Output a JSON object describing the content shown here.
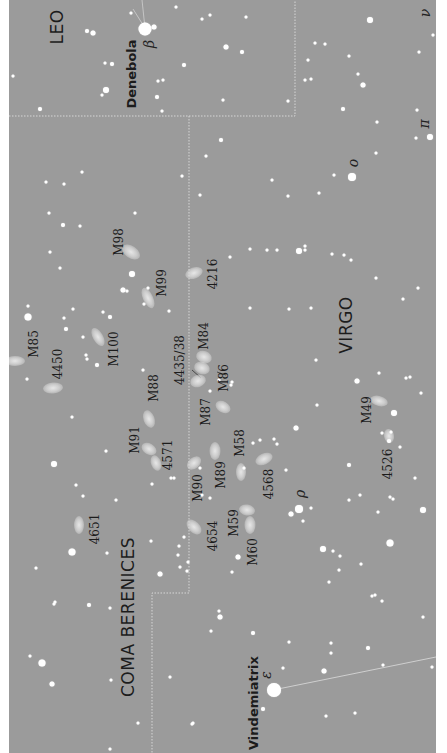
{
  "map": {
    "type": "star_chart",
    "orientation": "rotated -90deg",
    "colors": {
      "background": "#9b9b9b",
      "margin": "#ffffff",
      "stars": "#ffffff",
      "labels": "#1c1c1c",
      "boundary": "#cfcfcf"
    },
    "constellations": [
      {
        "name": "LEO",
        "x": 57,
        "y": 27
      },
      {
        "name": "VIRGO",
        "x": 337,
        "y": 325
      },
      {
        "name": "COMA BERENICES",
        "x": 128,
        "y": 617
      }
    ],
    "named_stars": [
      {
        "name": "Denebola",
        "greek": "β",
        "x": 131,
        "y": 74,
        "gx": 149,
        "gy": 42
      },
      {
        "name": "Vindemiatrix",
        "greek": "ε",
        "x": 253,
        "y": 703,
        "gx": 266,
        "gy": 673
      }
    ],
    "greek_labels": [
      {
        "letter": "ο",
        "x": 353,
        "y": 161
      },
      {
        "letter": "π",
        "x": 424,
        "y": 123
      },
      {
        "letter": "ν",
        "x": 425,
        "y": 13
      },
      {
        "letter": "ρ",
        "x": 300,
        "y": 496
      }
    ],
    "objects": [
      {
        "label": "M98",
        "x": 119,
        "y": 242
      },
      {
        "label": "M99",
        "x": 162,
        "y": 283
      },
      {
        "label": "4216",
        "x": 213,
        "y": 274
      },
      {
        "label": "M85",
        "x": 34,
        "y": 344
      },
      {
        "label": "4450",
        "x": 58,
        "y": 364
      },
      {
        "label": "M100",
        "x": 114,
        "y": 349
      },
      {
        "label": "M84",
        "x": 204,
        "y": 336
      },
      {
        "label": "4435/38",
        "x": 180,
        "y": 360
      },
      {
        "label": "M86",
        "x": 224,
        "y": 378
      },
      {
        "label": "M88",
        "x": 154,
        "y": 388
      },
      {
        "label": "M87",
        "x": 206,
        "y": 412
      },
      {
        "label": "M91",
        "x": 135,
        "y": 440
      },
      {
        "label": "4571",
        "x": 168,
        "y": 455
      },
      {
        "label": "M58",
        "x": 240,
        "y": 443
      },
      {
        "label": "M89",
        "x": 221,
        "y": 475
      },
      {
        "label": "M90",
        "x": 198,
        "y": 488
      },
      {
        "label": "4568",
        "x": 269,
        "y": 484
      },
      {
        "label": "M49",
        "x": 367,
        "y": 410
      },
      {
        "label": "4526",
        "x": 388,
        "y": 464
      },
      {
        "label": "4651",
        "x": 95,
        "y": 529
      },
      {
        "label": "M59",
        "x": 234,
        "y": 523
      },
      {
        "label": "4654",
        "x": 213,
        "y": 536
      },
      {
        "label": "M60",
        "x": 253,
        "y": 552
      }
    ],
    "galaxies": [
      {
        "x": 131,
        "y": 252,
        "w": 20,
        "h": 12,
        "rot": 35
      },
      {
        "x": 148,
        "y": 298,
        "w": 22,
        "h": 10,
        "rot": 65
      },
      {
        "x": 194,
        "y": 273,
        "w": 18,
        "h": 11,
        "rot": -20
      },
      {
        "x": 15,
        "y": 361,
        "w": 20,
        "h": 10,
        "rot": 0
      },
      {
        "x": 53,
        "y": 388,
        "w": 20,
        "h": 11,
        "rot": -5
      },
      {
        "x": 98,
        "y": 337,
        "w": 20,
        "h": 10,
        "rot": 60
      },
      {
        "x": 204,
        "y": 357,
        "w": 16,
        "h": 12,
        "rot": 20
      },
      {
        "x": 202,
        "y": 368,
        "w": 16,
        "h": 12,
        "rot": 20
      },
      {
        "x": 198,
        "y": 381,
        "w": 16,
        "h": 12,
        "rot": -20
      },
      {
        "x": 223,
        "y": 407,
        "w": 16,
        "h": 11,
        "rot": 30
      },
      {
        "x": 149,
        "y": 419,
        "w": 18,
        "h": 11,
        "rot": 70
      },
      {
        "x": 149,
        "y": 449,
        "w": 16,
        "h": 11,
        "rot": 30
      },
      {
        "x": 156,
        "y": 463,
        "w": 16,
        "h": 10,
        "rot": 70
      },
      {
        "x": 194,
        "y": 463,
        "w": 16,
        "h": 11,
        "rot": -40
      },
      {
        "x": 215,
        "y": 451,
        "w": 18,
        "h": 11,
        "rot": 90
      },
      {
        "x": 264,
        "y": 459,
        "w": 18,
        "h": 11,
        "rot": -25
      },
      {
        "x": 241,
        "y": 472,
        "w": 18,
        "h": 10,
        "rot": 90
      },
      {
        "x": 379,
        "y": 401,
        "w": 18,
        "h": 10,
        "rot": 15
      },
      {
        "x": 389,
        "y": 436,
        "w": 14,
        "h": 10,
        "rot": 80
      },
      {
        "x": 79,
        "y": 525,
        "w": 18,
        "h": 10,
        "rot": 90
      },
      {
        "x": 247,
        "y": 510,
        "w": 16,
        "h": 11,
        "rot": 10
      },
      {
        "x": 194,
        "y": 527,
        "w": 18,
        "h": 11,
        "rot": 45
      },
      {
        "x": 250,
        "y": 525,
        "w": 18,
        "h": 11,
        "rot": 90
      }
    ]
  }
}
